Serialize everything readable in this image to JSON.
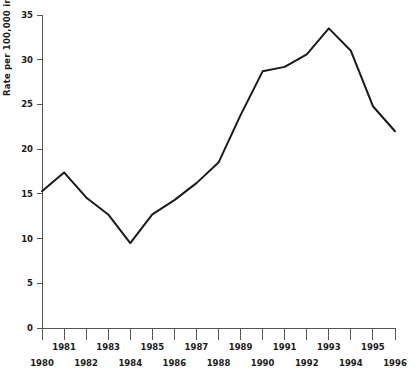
{
  "chart_data": {
    "type": "line",
    "title": "",
    "xlabel": "",
    "ylabel": "Rate per 100,000 inhabitants",
    "ylim": [
      0,
      35
    ],
    "xlim": [
      1980,
      1996
    ],
    "yticks": [
      0,
      5,
      10,
      15,
      20,
      25,
      30,
      35
    ],
    "ytick_labels": [
      "0",
      "5",
      "10",
      "15",
      "20",
      "25",
      "30",
      "35"
    ],
    "grid": false,
    "legend": null,
    "legend_position": "none",
    "categories": [
      1980,
      1981,
      1982,
      1983,
      1984,
      1985,
      1986,
      1987,
      1988,
      1989,
      1990,
      1991,
      1992,
      1993,
      1994,
      1995,
      1996
    ],
    "xtick_labels_upper": [
      "",
      "1981",
      "",
      "1983",
      "",
      "1985",
      "",
      "1987",
      "",
      "1989",
      "",
      "1991",
      "",
      "1993",
      "",
      "1995",
      ""
    ],
    "xtick_labels_lower": [
      "1980",
      "",
      "1982",
      "",
      "1984",
      "",
      "1986",
      "",
      "1988",
      "",
      "1990",
      "",
      "1992",
      "",
      "1994",
      "",
      "1996"
    ],
    "values": [
      15.3,
      17.4,
      14.6,
      12.7,
      9.5,
      12.7,
      14.3,
      16.2,
      18.5,
      23.8,
      28.7,
      29.2,
      30.6,
      33.5,
      31.0,
      24.8,
      22.0
    ],
    "series": [
      {
        "name": "Rate per 100,000 inhabitants",
        "color": "#1a1a1a",
        "values": [
          15.3,
          17.4,
          14.6,
          12.7,
          9.5,
          12.7,
          14.3,
          16.2,
          18.5,
          23.8,
          28.7,
          29.2,
          30.6,
          33.5,
          31.0,
          24.8,
          22.0
        ]
      }
    ],
    "annotations": []
  },
  "axes": {
    "y_axis_title": "Rate per 100,000 inhabitants"
  }
}
